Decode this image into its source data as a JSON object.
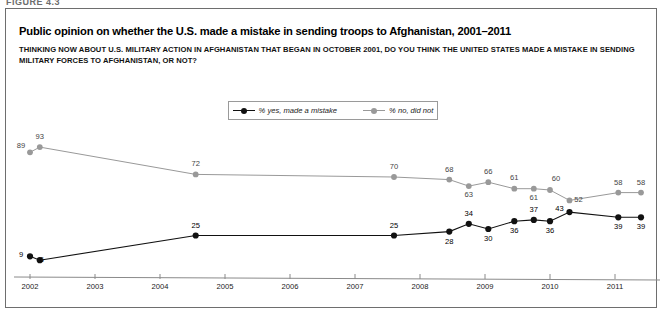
{
  "figure": {
    "label": "FIGURE 4.3"
  },
  "panel": {
    "title": "Public opinion on whether the U.S. made a mistake in sending troops to Afghanistan, 2001–2011",
    "subtitle": "THINKING NOW ABOUT U.S. MILITARY ACTION IN AFGHANISTAN THAT BEGAN IN OCTOBER 2001, DO YOU THINK THE UNITED STATES MADE A MISTAKE IN SENDING MILITARY FORCES TO AFGHANISTAN, OR NOT?"
  },
  "legend": {
    "position": "top-center",
    "items": [
      {
        "label": "% yes, made a mistake",
        "color": "#111111",
        "marker": "filled-circle"
      },
      {
        "label": "% no, did not",
        "color": "#999999",
        "marker": "filled-circle"
      }
    ]
  },
  "chart_data": {
    "type": "line",
    "title": "Public opinion on whether the U.S. made a mistake in sending troops to Afghanistan, 2001–2011",
    "xlabel": "",
    "ylabel": "",
    "xlim": [
      2002,
      2011.6
    ],
    "ylim": [
      0,
      100
    ],
    "grid": false,
    "legend_position": "top-center",
    "tick_labels": [
      "2002",
      "2003",
      "2004",
      "2005",
      "2006",
      "2007",
      "2008",
      "2009",
      "2010",
      "2011"
    ],
    "series": [
      {
        "name": "% yes, made a mistake",
        "color": "#111111",
        "x": [
          2002.0,
          2002.15,
          2004.55,
          2007.6,
          2008.45,
          2008.75,
          2009.05,
          2009.45,
          2009.75,
          2010.0,
          2010.3,
          2011.05,
          2011.4
        ],
        "values": [
          9,
          6,
          25,
          25,
          28,
          34,
          30,
          36,
          37,
          36,
          43,
          39,
          39
        ],
        "labels": [
          "9",
          "6",
          "25",
          "25",
          "28",
          "34",
          "30",
          "36",
          "37",
          "36",
          "43",
          "39",
          "39"
        ]
      },
      {
        "name": "% no, did not",
        "color": "#999999",
        "x": [
          2002.0,
          2002.15,
          2004.55,
          2007.6,
          2008.45,
          2008.75,
          2009.05,
          2009.45,
          2009.75,
          2010.0,
          2010.3,
          2011.05,
          2011.4
        ],
        "values": [
          89,
          93,
          72,
          70,
          68,
          63,
          66,
          61,
          61,
          60,
          52,
          58,
          58
        ],
        "labels": [
          "89",
          "93",
          "72",
          "70",
          "68",
          "63",
          "66",
          "61",
          "61",
          "60",
          "52",
          "58",
          "58"
        ]
      }
    ]
  }
}
